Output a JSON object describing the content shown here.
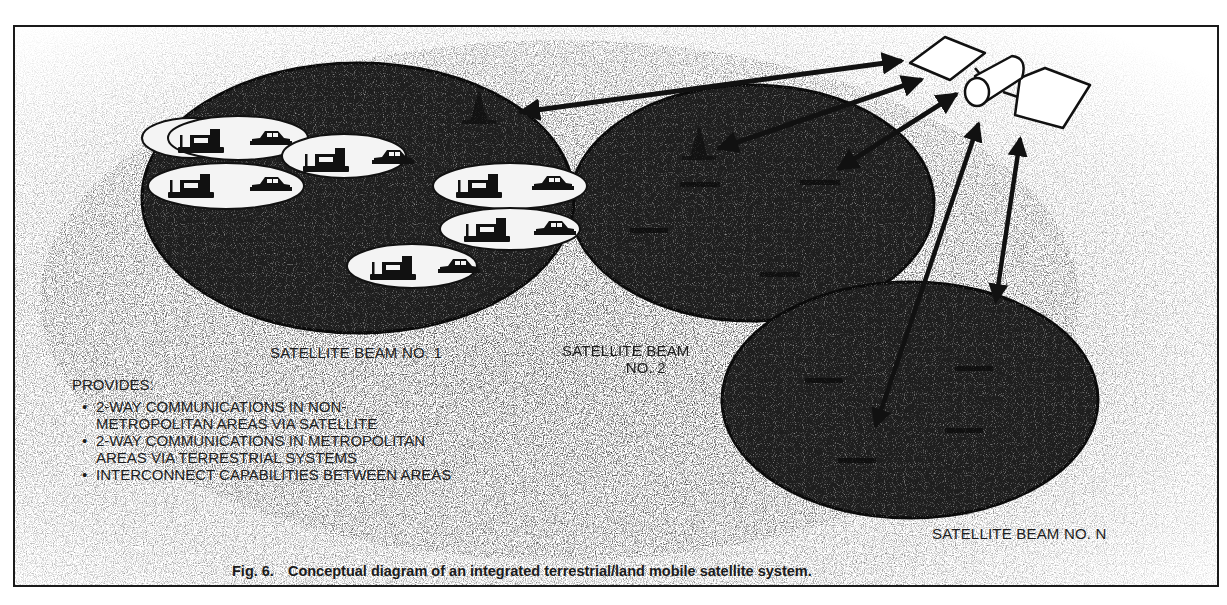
{
  "figure": {
    "number": "Fig. 6.",
    "caption": "Conceptual diagram of an integrated terrestrial/land mobile satellite system."
  },
  "beams": [
    {
      "id": "beam-1",
      "label": "SATELLITE BEAM NO. 1",
      "inner_label": "METROPOLITAN SYSTEMS",
      "fill": "#1e1e1e"
    },
    {
      "id": "beam-2",
      "label_line1": "SATELLITE BEAM",
      "label_line2": "NO. 2",
      "fill": "#1e1e1e"
    },
    {
      "id": "beam-n",
      "label": "SATELLITE BEAM NO. N",
      "fill": "#1e1e1e"
    }
  ],
  "metro_cells": [
    {
      "icons": [
        "truck-with-antenna",
        "car"
      ]
    },
    {
      "icons": [
        "truck-with-antenna",
        "car"
      ]
    },
    {
      "icons": [
        "truck-with-antenna",
        "car"
      ]
    },
    {
      "icons": [
        "truck-with-antenna",
        "car"
      ]
    },
    {
      "icons": [
        "truck-with-antenna",
        "car"
      ]
    },
    {
      "icons": [
        "truck-with-antenna",
        "car"
      ]
    }
  ],
  "satellite": {
    "icon": "satellite-with-solar-panels"
  },
  "provides": {
    "title": "PROVIDES:",
    "items": [
      {
        "line1": "2-WAY COMMUNICATIONS IN NON-",
        "line2": "METROPOLITAN AREAS VIA SATELLITE"
      },
      {
        "line1": "2-WAY COMMUNICATIONS IN METROPOLITAN",
        "line2": "AREAS VIA TERRESTRIAL SYSTEMS"
      },
      {
        "line1": "INTERCONNECT CAPABILITIES BETWEEN AREAS",
        "line2": ""
      }
    ]
  },
  "colors": {
    "ink": "#1a1a1a",
    "beam_fill": "#1e1e1e",
    "stipple": "#8a8a8a",
    "cell_fill": "#f4f4f4",
    "paper": "#ffffff"
  }
}
